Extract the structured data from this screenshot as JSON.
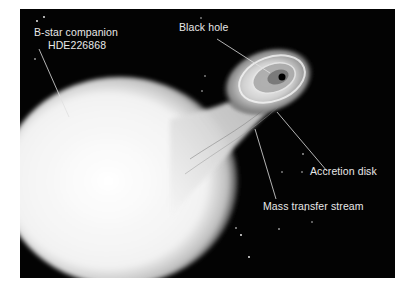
{
  "figure": {
    "labels": {
      "companion_line1": "B-star companion",
      "companion_line2": "HDE226868",
      "black_hole": "Black hole",
      "accretion_disk": "Accretion disk",
      "mass_transfer": "Mass transfer stream"
    },
    "colors": {
      "background": "#030303",
      "star": "#f4f4f4",
      "label_text": "#e8e8e8",
      "page": "#ffffff"
    }
  }
}
